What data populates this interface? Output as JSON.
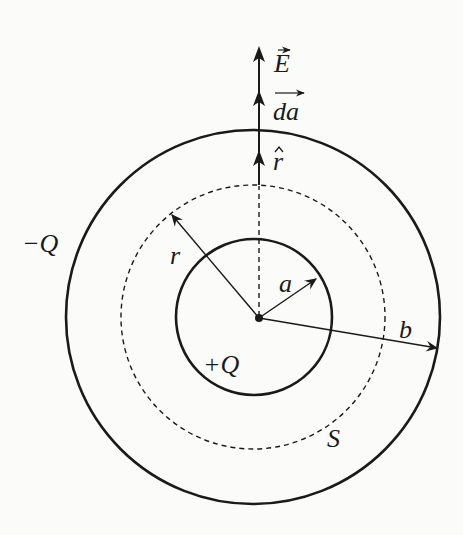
{
  "figure": {
    "colors": {
      "ink": "#1a1a1a",
      "background": "#fbfbfa"
    },
    "labels": {
      "E": "E",
      "da": "da",
      "r_hat": "r",
      "r": "r",
      "a": "a",
      "b": "b",
      "minus_Q": "−Q",
      "plus_Q": "+Q",
      "S": "S"
    },
    "circles": [
      {
        "name": "inner-sphere",
        "radius_label": "a",
        "style": "solid"
      },
      {
        "name": "gaussian-surface",
        "radius_label": "r",
        "style": "dashed"
      },
      {
        "name": "outer-shell",
        "radius_label": "b",
        "style": "solid"
      }
    ],
    "vectors": [
      "E",
      "da",
      "r-hat"
    ]
  }
}
